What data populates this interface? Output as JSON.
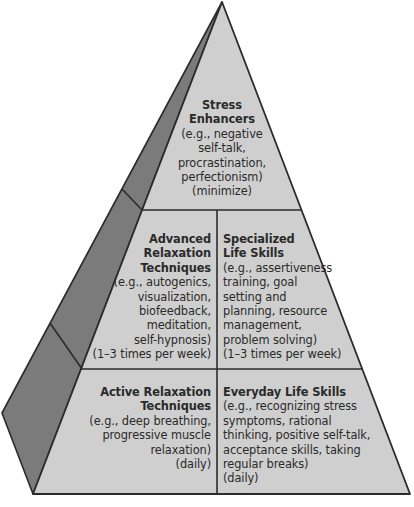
{
  "diagram": {
    "type": "pyramid",
    "colors": {
      "front_face": "#cfcfcf",
      "side_face": "#7b7b7b",
      "outline": "#2b2b2b",
      "text": "#2a2a2a"
    },
    "tiers": {
      "top": {
        "title_lines": [
          "Stress",
          "Enhancers"
        ],
        "detail_lines": [
          "(e.g., negative",
          "self-talk,",
          "procrastination,",
          "perfectionism)",
          "(minimize)"
        ]
      },
      "middle_left": {
        "title_lines": [
          "Advanced",
          "Relaxation",
          "Techniques"
        ],
        "detail_lines": [
          "(e.g., autogenics,",
          "visualization,",
          "biofeedback,",
          "meditation,",
          "self-hypnosis)",
          "(1–3 times per week)"
        ]
      },
      "middle_right": {
        "title_lines": [
          "Specialized",
          "Life Skills"
        ],
        "detail_lines": [
          "(e.g., assertiveness",
          "training, goal",
          "setting and",
          "planning, resource",
          "management,",
          "problem solving)",
          "(1–3 times per week)"
        ]
      },
      "bottom_left": {
        "title_lines": [
          "Active Relaxation",
          "Techniques"
        ],
        "detail_lines": [
          "(e.g., deep breathing,",
          "progressive muscle",
          "relaxation)",
          "(daily)"
        ]
      },
      "bottom_right": {
        "title_lines": [
          "Everyday Life Skills"
        ],
        "detail_lines": [
          "(e.g., recognizing stress",
          "symptoms, rational",
          "thinking, positive self-talk,",
          "acceptance skills, taking",
          "regular breaks)",
          "(daily)"
        ]
      }
    }
  }
}
